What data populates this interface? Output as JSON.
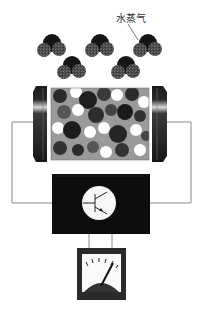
{
  "figure": {
    "label": "水蒸气",
    "label_meaning": "water vapor",
    "components": {
      "molecules": [
        {
          "cx": 52,
          "cy": 46
        },
        {
          "cx": 100,
          "cy": 46
        },
        {
          "cx": 148,
          "cy": 46
        },
        {
          "cx": 72,
          "cy": 68
        },
        {
          "cx": 126,
          "cy": 68
        }
      ],
      "sensor": {
        "name": "humidity sensor element"
      },
      "amplifier": {
        "name": "transistor amplifier"
      },
      "meter": {
        "name": "analog meter"
      }
    },
    "colors": {
      "black": "#111111",
      "dark_gray": "#3a3a3a",
      "mid_gray": "#6e6e6e",
      "light_gray": "#a8a8a8",
      "wire": "#8a8a8a",
      "white": "#ffffff"
    }
  }
}
